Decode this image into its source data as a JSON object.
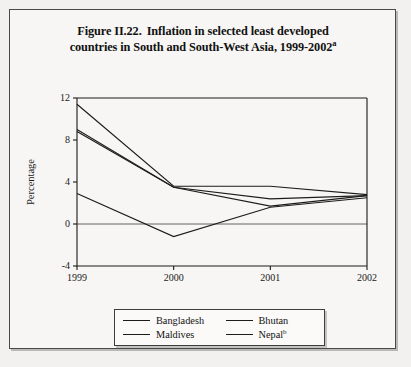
{
  "figure": {
    "label": "Figure II.22.",
    "title_line1": "Inflation in selected least developed",
    "title_line2": "countries in South and South-West Asia, 1999-2002",
    "title_superscript": "a"
  },
  "legend": {
    "entries": [
      {
        "label": "Bangladesh",
        "color": "#1c1c1c"
      },
      {
        "label": "Bhutan",
        "color": "#1c1c1c"
      },
      {
        "label": "Maldives",
        "color": "#1c1c1c"
      },
      {
        "label": "Nepal",
        "superscript": "b",
        "color": "#1c1c1c"
      }
    ]
  },
  "chart_data": {
    "type": "line",
    "xlabel": "",
    "ylabel": "Percentage",
    "x": [
      "1999",
      "2000",
      "2001",
      "2002"
    ],
    "xtick_labels": [
      "1999",
      "2000",
      "2001",
      "2002"
    ],
    "ytick_labels": [
      "-4",
      "0",
      "4",
      "8",
      "12"
    ],
    "yticks": [
      -4,
      0,
      4,
      8,
      12
    ],
    "ylim": [
      -4,
      12
    ],
    "grid": false,
    "zero_line": true,
    "legend_position": "bottom",
    "series": [
      {
        "name": "Bangladesh",
        "values": [
          8.8,
          3.5,
          1.7,
          2.7
        ]
      },
      {
        "name": "Bhutan",
        "values": [
          9.0,
          3.5,
          2.4,
          2.7
        ]
      },
      {
        "name": "Maldives",
        "values": [
          2.9,
          -1.2,
          1.6,
          2.5
        ]
      },
      {
        "name": "Nepal",
        "values": [
          11.4,
          3.6,
          3.6,
          2.8
        ]
      }
    ]
  }
}
